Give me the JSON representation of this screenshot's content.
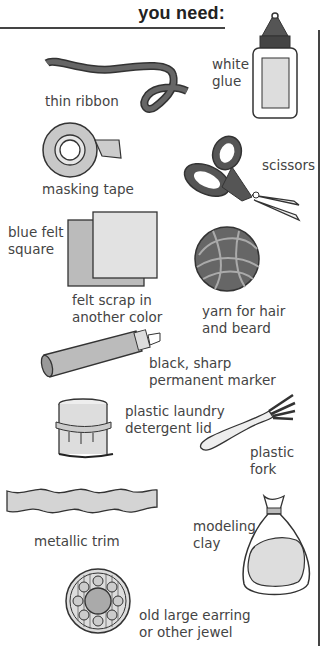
{
  "header": {
    "title": "you need:"
  },
  "items": [
    {
      "id": "ribbon",
      "label": "thin ribbon",
      "icon": "ribbon-icon"
    },
    {
      "id": "glue",
      "label": "white\nglue",
      "icon": "glue-bottle-icon"
    },
    {
      "id": "tape",
      "label": "masking tape",
      "icon": "tape-roll-icon"
    },
    {
      "id": "scissors",
      "label": "scissors",
      "icon": "scissors-icon"
    },
    {
      "id": "felt-blue",
      "label": "blue felt\nsquare",
      "icon": "felt-square-icon"
    },
    {
      "id": "felt-scrap",
      "label": "felt scrap in\nanother color",
      "icon": "felt-square-icon"
    },
    {
      "id": "yarn",
      "label": "yarn for hair\nand beard",
      "icon": "yarn-ball-icon"
    },
    {
      "id": "marker",
      "label": "black, sharp\npermanent marker",
      "icon": "marker-icon"
    },
    {
      "id": "lid",
      "label": "plastic laundry\ndetergent lid",
      "icon": "detergent-lid-icon"
    },
    {
      "id": "fork",
      "label": "plastic\nfork",
      "icon": "fork-icon"
    },
    {
      "id": "trim",
      "label": "metallic trim",
      "icon": "metallic-trim-icon"
    },
    {
      "id": "clay",
      "label": "modeling\nclay",
      "icon": "clay-bag-icon"
    },
    {
      "id": "jewel",
      "label": "old large earring\nor other jewel",
      "icon": "jewel-icon"
    }
  ],
  "colors": {
    "ink": "#333333",
    "fill_light": "#d9d9d9",
    "fill_mid": "#bdbdbd",
    "fill_dark": "#555555"
  }
}
